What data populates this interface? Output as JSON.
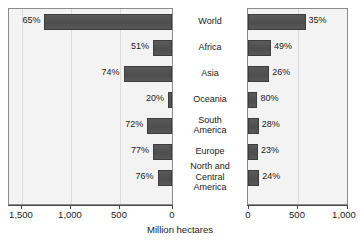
{
  "chart_data": {
    "type": "bar",
    "title": "",
    "subtitle": "",
    "xlabel": "Million hectares",
    "ylabel": "",
    "orientation": "horizontal",
    "layout": "back-to-back diverging bar chart (butterfly), two panels sharing centered category labels",
    "grid": true,
    "legend_position": "none",
    "categories": [
      "World",
      "Africa",
      "Asia",
      "Oceania",
      "South\nAmerica",
      "Europe",
      "North and\nCentral\nAmerica"
    ],
    "left_panel": {
      "axis_direction": "right-to-left",
      "xlim": [
        0,
        1750
      ],
      "ticks": [
        1500,
        1000,
        500,
        0
      ],
      "tick_labels": [
        "1,500",
        "1,000",
        "500",
        "0"
      ],
      "values": [
        1370,
        205,
        520,
        40,
        265,
        205,
        155
      ],
      "data_labels": [
        "65%",
        "51%",
        "74%",
        "20%",
        "72%",
        "77%",
        "76%"
      ],
      "percents": [
        65,
        51,
        74,
        20,
        72,
        77,
        76
      ]
    },
    "right_panel": {
      "axis_direction": "left-to-right",
      "xlim": [
        0,
        1100
      ],
      "ticks": [
        0,
        500,
        1000
      ],
      "tick_labels": [
        "0",
        "500",
        "1,000"
      ],
      "values": [
        640,
        255,
        235,
        105,
        120,
        110,
        125
      ],
      "data_labels": [
        "35%",
        "49%",
        "26%",
        "80%",
        "28%",
        "23%",
        "24%"
      ],
      "percents": [
        35,
        49,
        26,
        80,
        28,
        23,
        24
      ]
    },
    "colors": {
      "bar": "#4e4e4e",
      "bar_border": "#3d3d3d",
      "plot_background": "#f3f3f3",
      "panel_border": "#8c8c8c",
      "gridline": "#dcdcdc",
      "text": "#1a1a1a",
      "axis": "#4a4a4a"
    }
  }
}
